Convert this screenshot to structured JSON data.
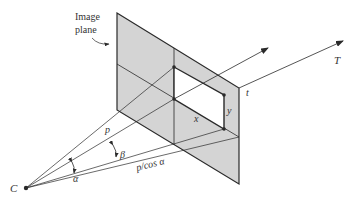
{
  "diagram": {
    "labels": {
      "image_plane_line1": "Image",
      "image_plane_line2": "plane",
      "center": "C",
      "axis_T": "T",
      "axis_t": "t",
      "x": "x",
      "y": "y",
      "p": "p",
      "p_cos_alpha": "p/cos α",
      "alpha": "α",
      "beta": "β"
    },
    "colors": {
      "plane_fill": "#d4d4d4",
      "line": "#2a2a2a",
      "window_fill": "#ffffff",
      "text": "#333333"
    }
  }
}
